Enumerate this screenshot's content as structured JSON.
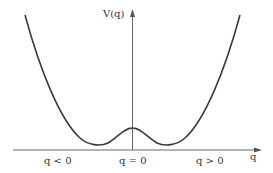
{
  "diagram": {
    "y_axis_label": "V(q)",
    "x_axis_label": "q",
    "region_labels": {
      "left": "q < 0",
      "center": "q = 0",
      "right": "q > 0"
    },
    "colors": {
      "curve": "#3a3a3a",
      "axis": "#555555",
      "text": "#333333",
      "background": "#ffffff"
    }
  }
}
